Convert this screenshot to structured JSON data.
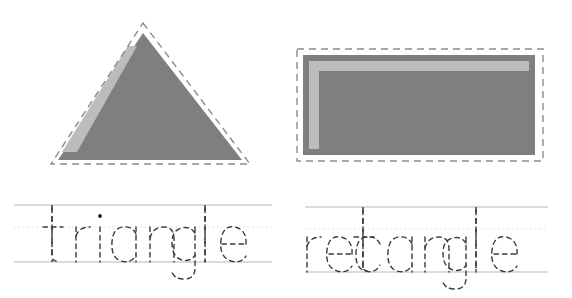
{
  "worksheet": {
    "title": "Shape Tracing Worksheet",
    "width": 572,
    "height": 298,
    "background_color": "#ffffff"
  },
  "palette": {
    "shape_fill": "#7f7f7f",
    "shape_highlight": "#bcbcbc",
    "dashed_outline": "#8c8c8c",
    "guide_line_solid": "#cfcfcf",
    "guide_line_dotted": "#d9d9d9",
    "letter_outline": "#3a3a3a",
    "ascender_guide": "#3a3a3a"
  },
  "items": [
    {
      "id": "triangle",
      "shape_name": "triangle",
      "shape_kind": "triangle",
      "word": "triangle",
      "letters": [
        "t",
        "r",
        "i",
        "a",
        "n",
        "g",
        "l",
        "e"
      ],
      "has_dashed_outline": true,
      "has_highlight_stripe": true,
      "highlight_position": "left-edge-diagonal"
    },
    {
      "id": "rectangle",
      "shape_name": "rectangle",
      "shape_kind": "rectangle",
      "word": "rectangle",
      "letters": [
        "r",
        "e",
        "c",
        "t",
        "a",
        "n",
        "g",
        "l",
        "e"
      ],
      "has_dashed_outline": true,
      "has_highlight_stripe": true,
      "highlight_position": "top-and-left-inner-edge"
    }
  ],
  "guides": {
    "triangle_word": {
      "top_line_y": 25,
      "mid_line_y": 47,
      "baseline_y": 82,
      "line_start_x": 14,
      "line_end_x": 272,
      "ascender_x_positions": [
        52,
        205
      ]
    },
    "rectangle_word": {
      "top_line_y": 27,
      "mid_line_y": 49,
      "baseline_y": 92,
      "line_start_x": 19,
      "line_end_x": 262,
      "ascender_x_positions": [
        77,
        130
      ]
    }
  }
}
